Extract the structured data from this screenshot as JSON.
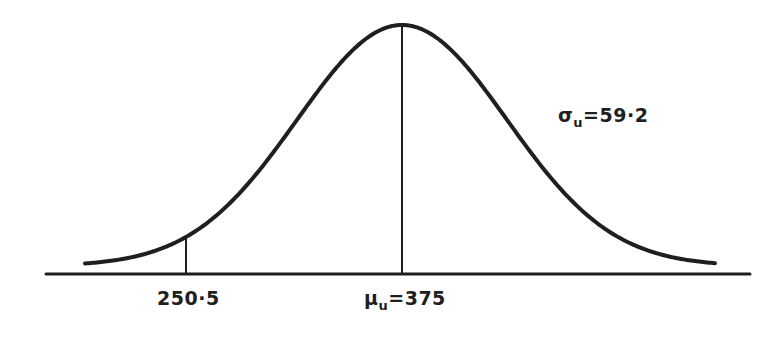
{
  "diagram": {
    "type": "normal-distribution-curve",
    "stroke_color": "#1f1f1f",
    "background": "#ffffff",
    "labels": {
      "sigma": {
        "symbol": "σ",
        "subscript": "u",
        "equals": "=",
        "value": "59·2"
      },
      "mean": {
        "symbol": "μ",
        "subscript": "u",
        "equals": "=",
        "value": "375"
      },
      "marker": {
        "value": "250·5"
      }
    },
    "parameters": {
      "mean": 375,
      "std_dev": 59.2,
      "marked_value": 250.5
    },
    "geometry": {
      "axis": {
        "x1": 46,
        "x2": 750,
        "y": 274
      },
      "curve": {
        "center_x": 402,
        "sigma_px": 105,
        "base_y": 266,
        "amplitude": 241,
        "x_start": 85,
        "x_end": 716
      },
      "mean_line": {
        "x": 402,
        "y_top": 25,
        "y_bottom": 274
      },
      "marker_line": {
        "x": 186,
        "y_bottom": 274
      }
    }
  }
}
